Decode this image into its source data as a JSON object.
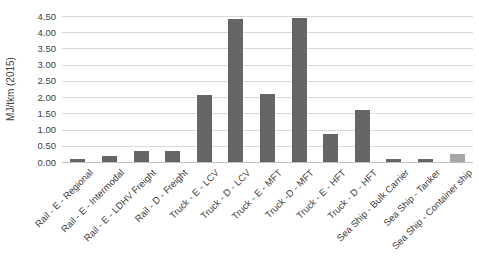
{
  "chart_data": {
    "type": "bar",
    "title": "",
    "xlabel": "",
    "ylabel": "MJ/tkm (2015)",
    "ylim": [
      0,
      4.5
    ],
    "ytick_step": 0.5,
    "yticks": [
      "0.00",
      "0.50",
      "1.00",
      "1.50",
      "2.00",
      "2.50",
      "3.00",
      "3.50",
      "4.00",
      "4.50"
    ],
    "grid": true,
    "legend_position": "none",
    "categories": [
      "Rail - E - Regional",
      "Rail - E - Intermodal",
      "Rail - E - LDHV Freight",
      "Rail - D - Freight",
      "Truck - E - LCV",
      "Truck - D - LCV",
      "Truck - E - MFT",
      "Truck -D - MFT",
      "Truck - E - HFT",
      "Truck - D - HFT",
      "Sea Ship - Bulk Carrier",
      "Sea Ship - Tanker",
      "Sea Ship - Container ship"
    ],
    "values": [
      0.1,
      0.17,
      0.35,
      0.33,
      2.05,
      4.4,
      2.1,
      4.45,
      0.85,
      1.6,
      0.08,
      0.1,
      0.25
    ],
    "bar_colors": [
      "#666666",
      "#666666",
      "#666666",
      "#666666",
      "#666666",
      "#666666",
      "#666666",
      "#666666",
      "#666666",
      "#666666",
      "#666666",
      "#666666",
      "#a6a6a6"
    ],
    "colors": {
      "bar_default": "#666666",
      "bar_highlight": "#a6a6a6",
      "gridline": "#d9d9d9",
      "axis_line": "#bfbfbf",
      "text": "#404040",
      "background": "#ffffff"
    }
  }
}
